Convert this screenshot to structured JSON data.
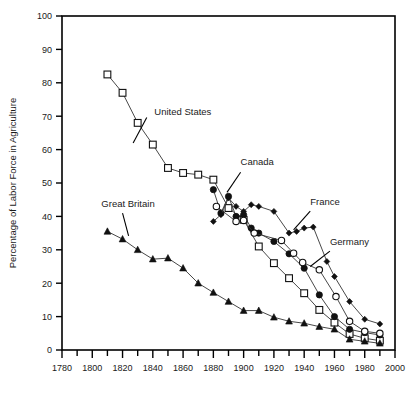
{
  "chart_data": {
    "type": "line",
    "title": "",
    "xlabel": "",
    "ylabel": "Percentage of Labor Force in Agriculture",
    "xlim": [
      1780,
      2000
    ],
    "ylim": [
      0,
      100
    ],
    "xticks": [
      1780,
      1800,
      1820,
      1840,
      1860,
      1880,
      1900,
      1920,
      1940,
      1960,
      1980,
      2000
    ],
    "xticklabels": [
      "1780",
      "1800",
      "1820",
      "1840",
      "1860",
      "1880",
      "1900",
      "1920",
      "1940",
      "1960",
      "1980",
      "2000"
    ],
    "xminor_step": 10,
    "yticks": [
      0,
      10,
      20,
      30,
      40,
      50,
      60,
      70,
      80,
      90,
      100
    ],
    "yticklabels": [
      "0",
      "10",
      "20",
      "30",
      "40",
      "50",
      "60",
      "70",
      "80",
      "90",
      "100"
    ],
    "grid": false,
    "legend": "annotations",
    "series": [
      {
        "name": "United States",
        "marker": "open-square",
        "x": [
          1810,
          1820,
          1830,
          1840,
          1850,
          1860,
          1870,
          1880,
          1890,
          1900,
          1910,
          1920,
          1930,
          1940,
          1950,
          1960,
          1970,
          1980,
          1990
        ],
        "values": [
          82.5,
          77.0,
          68.0,
          61.5,
          54.5,
          53.0,
          52.5,
          51.0,
          42.5,
          39.0,
          31.0,
          26.0,
          21.5,
          17.0,
          12.0,
          8.2,
          4.8,
          3.5,
          2.8
        ]
      },
      {
        "name": "Canada",
        "marker": "filled-circle",
        "x": [
          1880,
          1885,
          1890,
          1895,
          1900,
          1905,
          1910,
          1920,
          1930,
          1940,
          1950,
          1960,
          1970,
          1980,
          1990
        ],
        "values": [
          48.0,
          41.0,
          46.0,
          40.0,
          40.5,
          36.5,
          35.0,
          32.5,
          28.8,
          24.5,
          16.5,
          10.0,
          6.2,
          5.2,
          4.5
        ]
      },
      {
        "name": "Germany",
        "marker": "open-circle",
        "x": [
          1882,
          1895,
          1900,
          1907,
          1925,
          1933,
          1939,
          1950,
          1961,
          1970,
          1980,
          1990
        ],
        "values": [
          43.0,
          38.5,
          38.8,
          35.0,
          32.8,
          29.0,
          26.2,
          24.0,
          16.0,
          8.6,
          5.6,
          5.0
        ]
      },
      {
        "name": "France",
        "marker": "filled-diamond",
        "x": [
          1880,
          1885,
          1890,
          1895,
          1900,
          1905,
          1910,
          1920,
          1930,
          1935,
          1940,
          1946,
          1955,
          1960,
          1970,
          1980,
          1990
        ],
        "values": [
          38.5,
          40.5,
          45.5,
          43.0,
          41.5,
          43.5,
          43.0,
          41.5,
          35.0,
          35.5,
          36.5,
          36.8,
          26.5,
          22.0,
          14.5,
          9.2,
          7.8
        ]
      },
      {
        "name": "Great Britain",
        "marker": "filled-triangle",
        "x": [
          1810,
          1820,
          1830,
          1840,
          1850,
          1860,
          1870,
          1880,
          1890,
          1900,
          1910,
          1920,
          1930,
          1940,
          1950,
          1960,
          1970,
          1980,
          1990
        ],
        "values": [
          35.5,
          33.2,
          30.0,
          27.2,
          27.5,
          24.5,
          20.0,
          17.2,
          14.5,
          11.8,
          11.8,
          9.8,
          8.6,
          8.0,
          7.0,
          6.2,
          3.2,
          2.6,
          2.0
        ]
      }
    ],
    "annotations": [
      {
        "label": "United States",
        "x": 1840,
        "y": 70
      },
      {
        "label": "Canada",
        "x": 1903,
        "y": 55
      },
      {
        "label": "France",
        "x": 1948,
        "y": 43
      },
      {
        "label": "Germany",
        "x": 1962,
        "y": 31
      },
      {
        "label": "Great Britain",
        "x": 1818,
        "y": 42
      }
    ],
    "colors": {
      "axis": "#000000",
      "line": "#333333",
      "marker_fill": "#111111",
      "marker_open": "#ffffff",
      "text": "#1a1a1a",
      "background": "#ffffff"
    }
  }
}
